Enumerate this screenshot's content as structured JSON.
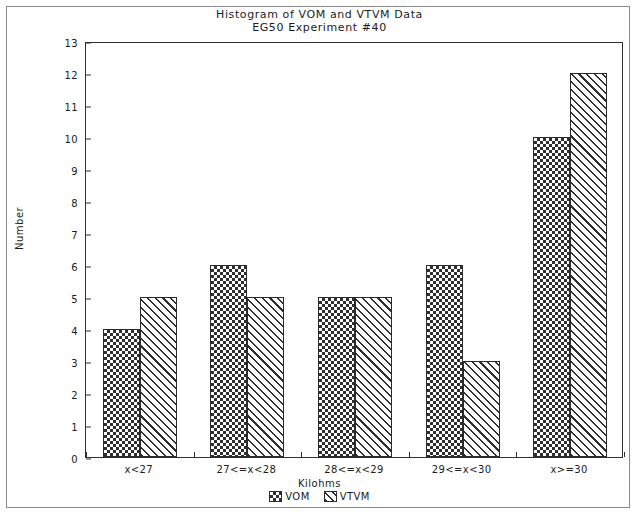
{
  "frame": {
    "border_color": "#8a8a8a"
  },
  "chart_data": {
    "type": "bar",
    "title": "Histogram of VOM and VTVM Data",
    "subtitle": "EG50 Experiment #40",
    "xlabel": "Kilohms",
    "ylabel": "Number",
    "categories": [
      "x<27",
      "27<=x<28",
      "28<=x<29",
      "29<=x<30",
      "x>=30"
    ],
    "series": [
      {
        "name": "VOM",
        "pattern": "cross-hatch",
        "values": [
          4,
          6,
          5,
          6,
          10
        ]
      },
      {
        "name": "VTVM",
        "pattern": "diagonal-stripes",
        "values": [
          5,
          5,
          5,
          3,
          12
        ]
      }
    ],
    "ylim": [
      0,
      13
    ],
    "yticks": [
      0,
      1,
      2,
      3,
      4,
      5,
      6,
      7,
      8,
      9,
      10,
      11,
      12,
      13
    ],
    "ytick_labels": [
      "0",
      "1",
      "2",
      "3",
      "4",
      "5",
      "6",
      "7",
      "8",
      "9",
      "10",
      "11",
      "12",
      "13"
    ],
    "grid": false,
    "legend_position": "bottom-center",
    "bar_color": "#2f2f2f",
    "axis_color": "#303030"
  }
}
